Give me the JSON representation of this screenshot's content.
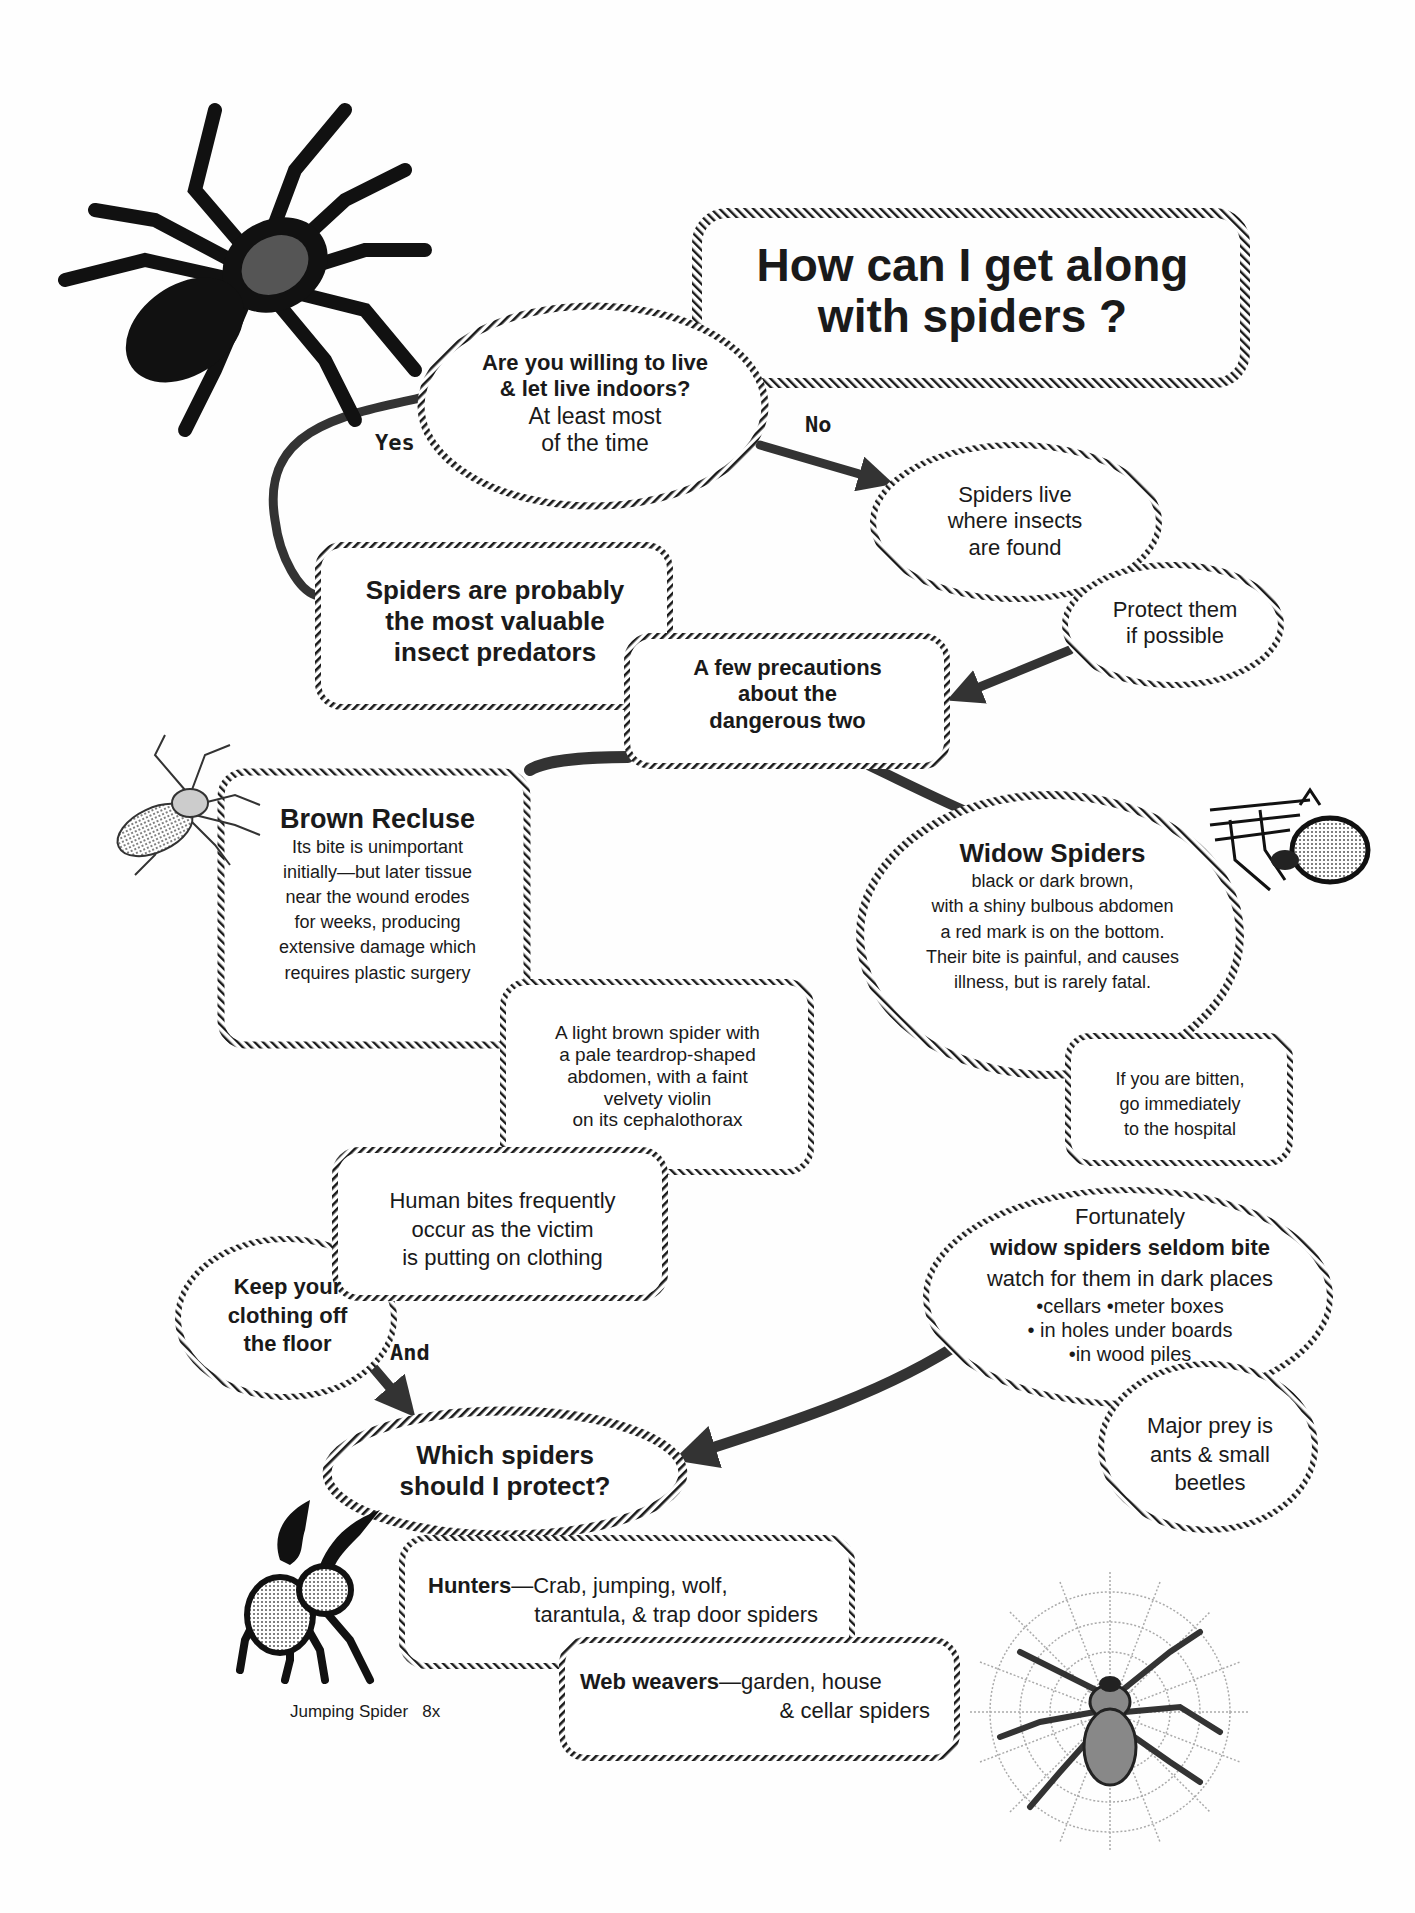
{
  "title": {
    "line1": "How can I get along",
    "line2": "with spiders ?"
  },
  "nodes": {
    "q_live": {
      "bold1": "Are you willing to live",
      "bold2": "& let live indoors?",
      "line3": "At least most",
      "line4": "of the time"
    },
    "yes_label": "Yes",
    "no_label": "No",
    "and_label": "And",
    "spiders_live": {
      "line1": "Spiders live",
      "line2": "where insects",
      "line3": "are found"
    },
    "protect": {
      "line1": "Protect them",
      "line2": "if possible"
    },
    "valuable": {
      "line1": "Spiders are probably",
      "line2": "the most valuable",
      "line3": "insect predators"
    },
    "precautions": {
      "line1": "A few precautions",
      "line2": "about the",
      "line3": "dangerous two"
    },
    "brown_recluse": {
      "heading": "Brown Recluse",
      "lines": [
        "Its bite is unimportant",
        "initially—but later tissue",
        "near the wound erodes",
        "for weeks, producing",
        "extensive damage which",
        "requires plastic surgery"
      ]
    },
    "recluse_desc": {
      "lines": [
        "A light brown spider with",
        "a pale teardrop-shaped",
        "abdomen, with a faint",
        "velvety violin",
        "on its cephalothorax"
      ]
    },
    "widow": {
      "heading": "Widow Spiders",
      "lines": [
        "black or dark brown,",
        "with a shiny bulbous abdomen",
        "a red mark is on the bottom.",
        "Their bite is painful,  and causes",
        "illness, but is rarely fatal."
      ]
    },
    "bitten": {
      "lines": [
        "If you are  bitten,",
        "go immediately",
        "to the hospital"
      ]
    },
    "human_bites": {
      "lines": [
        "Human bites  frequently",
        "occur as the victim",
        "is putting on clothing"
      ]
    },
    "keep_clothing": {
      "lines": [
        "Keep your",
        "clothing off",
        "the floor"
      ]
    },
    "fortunately": {
      "line1": "Fortunately",
      "bold": "widow spiders seldom bite",
      "line3": "watch for them in dark places",
      "bullets": [
        "•cellars •meter boxes",
        "• in holes under boards",
        "•in wood piles"
      ]
    },
    "prey": {
      "lines": [
        "Major prey is",
        "ants & small",
        "beetles"
      ]
    },
    "which": {
      "line1": "Which spiders",
      "line2": "should I protect?"
    },
    "hunters": {
      "bold": "Hunters",
      "rest1": "—Crab, jumping, wolf,",
      "rest2": "tarantula, & trap door spiders"
    },
    "weavers": {
      "bold": "Web weavers",
      "rest1": "—garden, house",
      "rest2": "& cellar spiders"
    }
  },
  "captions": {
    "jumping_spider": "Jumping Spider   8x"
  },
  "illustrations": [
    "tarantula-icon",
    "brown-recluse-icon",
    "widow-spider-icon",
    "jumping-spider-icon",
    "web-spider-icon"
  ],
  "colors": {
    "ink": "#1a1a1a",
    "paper": "#fefefe",
    "arrow": "#333333",
    "stipple": "#9a9a9a"
  }
}
